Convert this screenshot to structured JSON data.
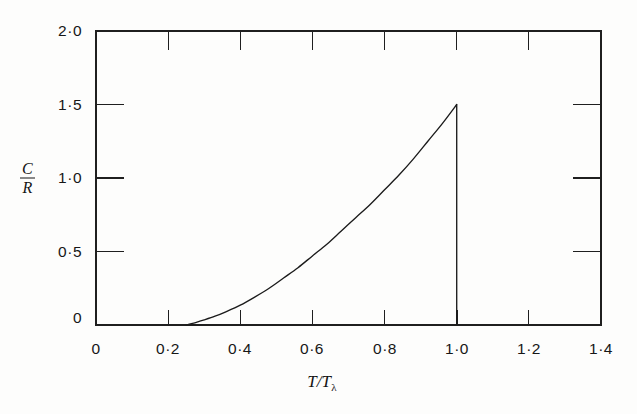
{
  "figure": {
    "background_color": "#fdfdfc",
    "ink_color": "#1b1b1b"
  },
  "axes": {
    "x_title_main": "T/T",
    "x_title_sub": "λ",
    "y_title_numerator": "C",
    "y_title_denominator": "R",
    "x_tick_labels": [
      "0",
      "0·2",
      "0·4",
      "0·6",
      "0·8",
      "1·0",
      "1·2",
      "1·4"
    ],
    "y_tick_labels": [
      "0",
      "0·5",
      "1·0",
      "1·5",
      "2·0"
    ]
  },
  "chart_data": {
    "type": "line",
    "title": "",
    "subtitle": "",
    "xlabel": "T/T_lambda",
    "ylabel": "C/R",
    "xlim": [
      0,
      1.4
    ],
    "ylim": [
      0,
      2.0
    ],
    "xticks": [
      0,
      0.2,
      0.4,
      0.6,
      0.8,
      1.0,
      1.2,
      1.4
    ],
    "yticks": [
      0,
      0.5,
      1.0,
      1.5,
      2.0
    ],
    "xtick_labels": [
      "0",
      "0·2",
      "0·4",
      "0·6",
      "0·8",
      "1·0",
      "1·2",
      "1·4"
    ],
    "ytick_labels": [
      "0",
      "0·5",
      "1·0",
      "1·5",
      "2·0"
    ],
    "grid": false,
    "legend": false,
    "frame": "box",
    "tick_direction": "in",
    "annotations": [],
    "series": [
      {
        "name": "C/R",
        "color": "#1b1b1b",
        "linewidth": 1.1,
        "comment": "Lambda-transition specific heat: convex rise from T/T_lambda = 0.25 to a peak of 1.5 at T/T_lambda = 1.0, then a vertical discontinuity down to zero.",
        "x": [
          0.25,
          0.28,
          0.3,
          0.33,
          0.36,
          0.4,
          0.44,
          0.48,
          0.52,
          0.56,
          0.6,
          0.64,
          0.68,
          0.72,
          0.76,
          0.8,
          0.84,
          0.88,
          0.92,
          0.96,
          1.0
        ],
        "y": [
          0.0,
          0.02,
          0.035,
          0.06,
          0.09,
          0.135,
          0.19,
          0.25,
          0.32,
          0.39,
          0.47,
          0.55,
          0.64,
          0.73,
          0.82,
          0.92,
          1.02,
          1.13,
          1.25,
          1.37,
          1.5
        ]
      },
      {
        "name": "discontinuity",
        "color": "#1b1b1b",
        "linewidth": 1.1,
        "comment": "Vertical drop at the lambda point.",
        "x": [
          1.0,
          1.0
        ],
        "y": [
          1.5,
          0.0
        ]
      }
    ]
  }
}
